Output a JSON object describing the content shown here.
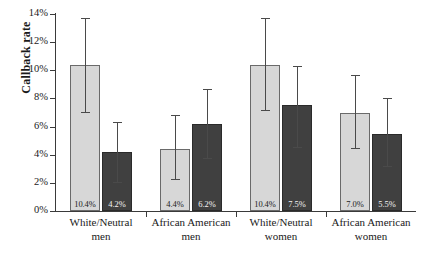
{
  "chart_data": {
    "type": "bar",
    "title": "",
    "xlabel": "",
    "ylabel": "Callback rate",
    "ylim": [
      0,
      14
    ],
    "ytick_labels": [
      "0%",
      "2%",
      "4%",
      "6%",
      "8%",
      "10%",
      "12%",
      "14%"
    ],
    "ytick_values": [
      0,
      2,
      4,
      6,
      8,
      10,
      12,
      14
    ],
    "grid": false,
    "legend": "none",
    "value_suffix": "%",
    "categories": [
      "White/Neutral men",
      "African American men",
      "White/Neutral women",
      "African American women"
    ],
    "category_lines": [
      [
        "White/Neutral",
        "men"
      ],
      [
        "African American",
        "men"
      ],
      [
        "White/Neutral",
        "women"
      ],
      [
        "African American",
        "women"
      ]
    ],
    "series": [
      {
        "name": "light",
        "color": "#d7d7d7",
        "values": [
          10.4,
          4.4,
          10.4,
          7.0
        ],
        "labels": [
          "10.4%",
          "4.4%",
          "10.4%",
          "7.0%"
        ],
        "err_low": [
          7.0,
          2.2,
          7.1,
          4.4
        ],
        "err_high": [
          13.7,
          6.8,
          13.7,
          9.7
        ]
      },
      {
        "name": "dark",
        "color": "#404040",
        "values": [
          4.2,
          6.2,
          7.5,
          5.5
        ],
        "labels": [
          "4.2%",
          "6.2%",
          "7.5%",
          "5.5%"
        ],
        "err_low": [
          2.0,
          3.7,
          4.5,
          3.1
        ],
        "err_high": [
          6.3,
          8.7,
          10.3,
          8.0
        ]
      }
    ]
  },
  "colors": {
    "light_bar": "#d7d7d7",
    "dark_bar": "#404040",
    "axis": "#3a3a3a",
    "error_bar": "#4a4a4a",
    "background": "#ffffff"
  }
}
